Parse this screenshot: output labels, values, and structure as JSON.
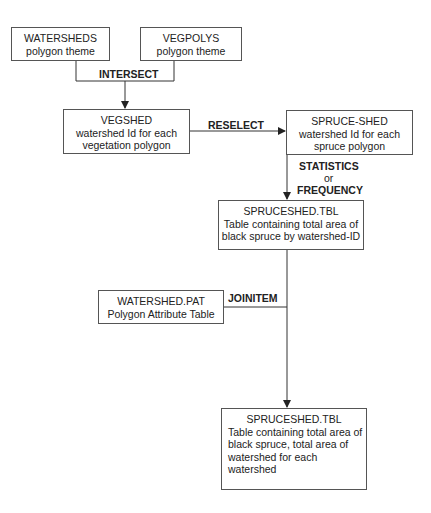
{
  "nodes": {
    "watersheds": {
      "title": "WATERSHEDS",
      "subtitle": "polygon theme"
    },
    "vegpolys": {
      "title": "VEGPOLYS",
      "subtitle": "polygon theme"
    },
    "vegshed": {
      "title": "VEGSHED",
      "lines": [
        "watershed Id for each",
        "vegetation polygon"
      ]
    },
    "spruce_shed": {
      "title": "SPRUCE-SHED",
      "lines": [
        "watershed Id for each",
        "spruce polygon"
      ]
    },
    "spruceshed_tbl": {
      "title": "SPRUCESHED.TBL",
      "lines": [
        "Table containing total area of",
        "black spruce by watershed-ID"
      ]
    },
    "watershed_pat": {
      "title": "WATERSHED.PAT",
      "subtitle": "Polygon Attribute Table"
    },
    "spruceshed_tbl_final": {
      "title": "SPRUCESHED.TBL",
      "lines": [
        "Table containing total area of",
        "black spruce, total area of",
        "watershed for each",
        "watershed"
      ]
    }
  },
  "operations": {
    "intersect": "INTERSECT",
    "reselect": "RESELECT",
    "statistics": "STATISTICS",
    "or": "or",
    "frequency": "FREQUENCY",
    "joinitem": "JOINITEM"
  },
  "colors": {
    "line": "#333333",
    "border": "#555555"
  }
}
